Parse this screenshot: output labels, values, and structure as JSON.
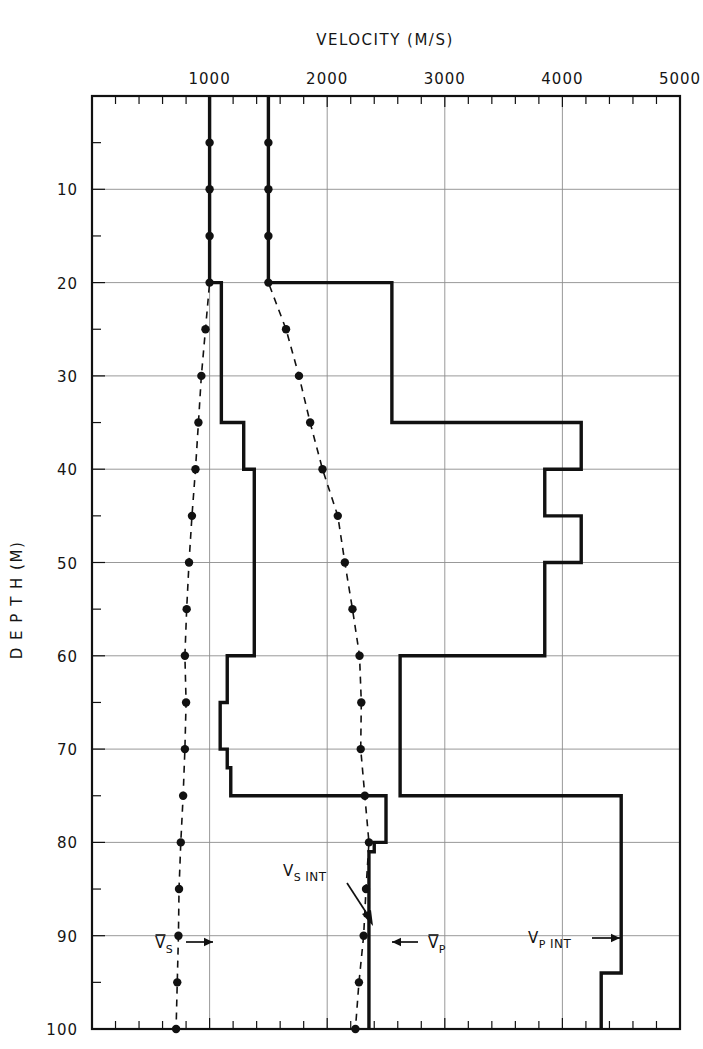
{
  "figure": {
    "title": "VELOCITY  (M/S)",
    "ylabel": "D E P T H   (M)"
  },
  "chart_data": {
    "type": "line",
    "title": "VELOCITY  (M/S)",
    "xlabel": "VELOCITY (M/S)",
    "ylabel": "DEPTH (M)",
    "xlim": [
      0,
      5000
    ],
    "ylim": [
      0,
      100
    ],
    "y_inverted": true,
    "grid": true,
    "x_major_ticks": [
      0,
      1000,
      2000,
      3000,
      4000,
      5000
    ],
    "x_tick_labels": [
      "",
      "1000",
      "2000",
      "3000",
      "4000",
      "5000"
    ],
    "x_minor_tick_step": 200,
    "y_major_ticks": [
      0,
      10,
      20,
      30,
      40,
      50,
      60,
      70,
      80,
      90,
      100
    ],
    "y_tick_labels": [
      "",
      "10",
      "20",
      "30",
      "40",
      "50",
      "60",
      "70",
      "80",
      "90",
      "100"
    ],
    "y_minor_tick_step": 5,
    "legend_position": "inline-annotations",
    "series": [
      {
        "name": "Vs_avg",
        "label": "V̄S",
        "style": "dashed-with-markers",
        "x_unit": "m/s",
        "y_unit": "m",
        "points": [
          {
            "depth": 5,
            "velocity": 1000
          },
          {
            "depth": 10,
            "velocity": 1000
          },
          {
            "depth": 15,
            "velocity": 1000
          },
          {
            "depth": 20,
            "velocity": 1000
          },
          {
            "depth": 25,
            "velocity": 965
          },
          {
            "depth": 30,
            "velocity": 930
          },
          {
            "depth": 35,
            "velocity": 905
          },
          {
            "depth": 40,
            "velocity": 880
          },
          {
            "depth": 45,
            "velocity": 850
          },
          {
            "depth": 50,
            "velocity": 825
          },
          {
            "depth": 55,
            "velocity": 805
          },
          {
            "depth": 60,
            "velocity": 790
          },
          {
            "depth": 65,
            "velocity": 800
          },
          {
            "depth": 70,
            "velocity": 790
          },
          {
            "depth": 75,
            "velocity": 775
          },
          {
            "depth": 80,
            "velocity": 755
          },
          {
            "depth": 85,
            "velocity": 740
          },
          {
            "depth": 90,
            "velocity": 735
          },
          {
            "depth": 95,
            "velocity": 725
          },
          {
            "depth": 100,
            "velocity": 715
          }
        ]
      },
      {
        "name": "Vp_avg",
        "label": "V̄P",
        "style": "dashed-with-markers",
        "x_unit": "m/s",
        "y_unit": "m",
        "points": [
          {
            "depth": 5,
            "velocity": 1500
          },
          {
            "depth": 10,
            "velocity": 1500
          },
          {
            "depth": 15,
            "velocity": 1500
          },
          {
            "depth": 20,
            "velocity": 1500
          },
          {
            "depth": 25,
            "velocity": 1650
          },
          {
            "depth": 30,
            "velocity": 1760
          },
          {
            "depth": 35,
            "velocity": 1855
          },
          {
            "depth": 40,
            "velocity": 1960
          },
          {
            "depth": 45,
            "velocity": 2090
          },
          {
            "depth": 50,
            "velocity": 2150
          },
          {
            "depth": 55,
            "velocity": 2215
          },
          {
            "depth": 60,
            "velocity": 2275
          },
          {
            "depth": 65,
            "velocity": 2290
          },
          {
            "depth": 70,
            "velocity": 2285
          },
          {
            "depth": 75,
            "velocity": 2320
          },
          {
            "depth": 80,
            "velocity": 2355
          },
          {
            "depth": 85,
            "velocity": 2330
          },
          {
            "depth": 90,
            "velocity": 2310
          },
          {
            "depth": 95,
            "velocity": 2270
          },
          {
            "depth": 100,
            "velocity": 2240
          }
        ]
      },
      {
        "name": "Vs_int",
        "label": "VS INT",
        "style": "solid-step",
        "x_unit": "m/s",
        "y_unit": "m",
        "steps": [
          {
            "top": 0,
            "bottom": 20,
            "velocity": 1000
          },
          {
            "top": 20,
            "bottom": 35,
            "velocity": 1100
          },
          {
            "top": 35,
            "bottom": 40,
            "velocity": 1290
          },
          {
            "top": 40,
            "bottom": 60,
            "velocity": 1380
          },
          {
            "top": 60,
            "bottom": 65,
            "velocity": 1150
          },
          {
            "top": 65,
            "bottom": 70,
            "velocity": 1090
          },
          {
            "top": 70,
            "bottom": 72,
            "velocity": 1150
          },
          {
            "top": 72,
            "bottom": 75,
            "velocity": 1180
          },
          {
            "top": 75,
            "bottom": 80,
            "velocity": 2500
          },
          {
            "top": 80,
            "bottom": 81,
            "velocity": 2400
          },
          {
            "top": 81,
            "bottom": 100,
            "velocity": 2355
          }
        ]
      },
      {
        "name": "Vp_int",
        "label": "VP INT",
        "style": "solid-step",
        "x_unit": "m/s",
        "y_unit": "m",
        "steps": [
          {
            "top": 0,
            "bottom": 20,
            "velocity": 1500
          },
          {
            "top": 20,
            "bottom": 35,
            "velocity": 2550
          },
          {
            "top": 35,
            "bottom": 40,
            "velocity": 4160
          },
          {
            "top": 40,
            "bottom": 45,
            "velocity": 3850
          },
          {
            "top": 45,
            "bottom": 50,
            "velocity": 4160
          },
          {
            "top": 50,
            "bottom": 60,
            "velocity": 3850
          },
          {
            "top": 60,
            "bottom": 75,
            "velocity": 2620
          },
          {
            "top": 75,
            "bottom": 94,
            "velocity": 4500
          },
          {
            "top": 94,
            "bottom": 100,
            "velocity": 4330
          }
        ]
      }
    ],
    "annotations": [
      {
        "name": "vs-avg-label",
        "text_main": "V",
        "text_sub": "S",
        "arrow": "right",
        "at_depth": 94,
        "at_velocity": 560
      },
      {
        "name": "vs-int-label",
        "text_main": "V",
        "text_sub": "S",
        "text_tail": "INT",
        "arrow": "down-right",
        "at_depth": 87,
        "at_velocity": 1620
      },
      {
        "name": "vp-avg-label",
        "text_main": "V",
        "text_sub": "P",
        "arrow": "left",
        "at_depth": 94,
        "at_velocity": 2720
      },
      {
        "name": "vp-int-label",
        "text_main": "V",
        "text_sub": "P",
        "text_tail": "INT",
        "arrow": "right",
        "at_depth": 93,
        "at_velocity": 3780
      }
    ]
  },
  "labels": {
    "vs_bar": "V",
    "vs_sub": "S",
    "vp_bar": "V",
    "vp_sub": "P",
    "int": "INT",
    "arrow_right": "→",
    "arrow_left": "←"
  },
  "colors": {
    "ink": "#111111",
    "grid": "#8d8d8d",
    "background": "#ffffff"
  }
}
